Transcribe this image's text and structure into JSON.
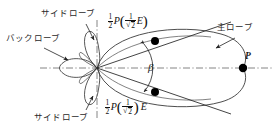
{
  "figure": {
    "type": "antenna-radiation-pattern",
    "title": "",
    "labels": {
      "side_lobe_top": "サイドローブ",
      "side_lobe_bottom": "サイドローブ",
      "back_lobe": "バックローブ",
      "main_lobe": "主ローブ",
      "beam_angle": "β",
      "field_point": "P"
    },
    "formulas": {
      "top": {
        "coefficient_num": "1",
        "coefficient_den": "2",
        "function": "P",
        "inner_num": "1",
        "inner_den": "2",
        "inner_radical": "√",
        "field": "E",
        "field_inside_parens": true
      },
      "bottom": {
        "coefficient_num": "1",
        "coefficient_den": "2",
        "function": "P",
        "inner_num": "1",
        "inner_den": "2",
        "inner_radical": "√",
        "field": "E",
        "field_inside_parens": false
      }
    },
    "colors": {
      "ink": "#1a1a1a",
      "curve": "#333333",
      "axis": "#555555",
      "marker": "#000000",
      "background": "#ffffff"
    },
    "geometry": {
      "origin_x": 97,
      "origin_y": 68,
      "axis_h_start_x": 40,
      "axis_h_end_x": 272,
      "axis_v_top_y": 20,
      "axis_v_bottom_y": 118,
      "main_lobe_tip_x": 243,
      "half_power_point_upper": [
        155,
        41
      ],
      "half_power_point_lower": [
        155,
        92
      ],
      "field_point_P": [
        243,
        68
      ]
    }
  }
}
